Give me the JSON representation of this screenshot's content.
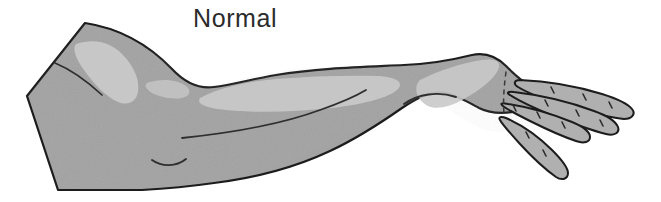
{
  "figure": {
    "caption": "Normal",
    "caption_position": {
      "x": 193,
      "y": 3
    },
    "orientation": "upper arm at left, hand at right, palm down",
    "background_color": "#ffffff",
    "canvas": {
      "width": 661,
      "height": 202
    }
  },
  "colors": {
    "skin_fill": "#a3a3a3",
    "skin_highlight": "#c9c9c9",
    "skin_highlight_bright": "#d6d6d6",
    "outline": "#1c1c1c",
    "crease_line": "#3a3a3a",
    "caption_text": "#2b2b2b",
    "background": "#ffffff"
  },
  "anatomy": {
    "parts": [
      {
        "name": "upper-arm",
        "label": "Upper arm"
      },
      {
        "name": "elbow",
        "label": "Elbow"
      },
      {
        "name": "forearm",
        "label": "Forearm"
      },
      {
        "name": "wrist",
        "label": "Wrist"
      },
      {
        "name": "hand",
        "label": "Hand"
      },
      {
        "name": "thumb",
        "label": "Thumb"
      },
      {
        "name": "index-finger",
        "label": "Index finger"
      },
      {
        "name": "middle-finger",
        "label": "Middle finger"
      },
      {
        "name": "ring-finger",
        "label": "Ring finger"
      }
    ],
    "highlights": [
      {
        "name": "upper-arm-highlight",
        "label": "Deltoid / biceps highlight"
      },
      {
        "name": "forearm-highlight",
        "label": "Forearm highlight"
      },
      {
        "name": "wrist-highlight",
        "label": "Wrist highlight"
      }
    ],
    "creases": [
      {
        "name": "biceps-contour-line",
        "label": "Biceps contour"
      },
      {
        "name": "elbow-crease",
        "label": "Elbow crease"
      },
      {
        "name": "forearm-muscle-line",
        "label": "Forearm muscle line"
      },
      {
        "name": "wrist-crease",
        "label": "Wrist crease"
      }
    ]
  }
}
